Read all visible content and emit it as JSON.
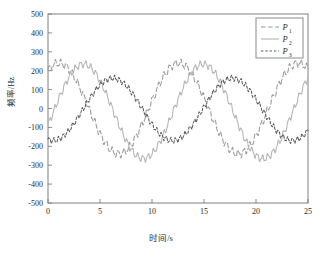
{
  "chart_data": {
    "type": "line",
    "title": "",
    "xlabel": "时间/s",
    "ylabel": "频率/Hz",
    "xlim": [
      0,
      25
    ],
    "ylim": [
      -500,
      500
    ],
    "xticks": [
      0,
      5,
      10,
      15,
      20,
      25
    ],
    "yticks": [
      -500,
      -400,
      -300,
      -200,
      -100,
      0,
      100,
      200,
      300,
      400,
      500
    ],
    "xticklabels": [
      "0",
      "5",
      "10",
      "15",
      "20",
      "25"
    ],
    "yticklabels": [
      "-500",
      "-400",
      "-300",
      "-200",
      "-100",
      "0",
      "100",
      "200",
      "300",
      "400",
      "500"
    ],
    "grid": false,
    "legend_position": "upper right",
    "legend": [
      {
        "name": "P1",
        "label": "P",
        "subscript": "1",
        "style": "long-dashed",
        "color": "#9a9a9a"
      },
      {
        "name": "P2",
        "label": "P",
        "subscript": "2",
        "style": "solid",
        "color": "#b3b3b3"
      },
      {
        "name": "P3",
        "label": "P",
        "subscript": "3",
        "style": "short-dashed",
        "color": "#5a5a5a"
      }
    ],
    "series": [
      {
        "name": "P1",
        "label": "P1",
        "color": "#9a9a9a",
        "style": "long-dashed",
        "amplitude": 240,
        "offset": 0,
        "period": 11.5,
        "phase_deg": 57,
        "noise_amplitude": 18,
        "noise_period": 0.55,
        "x": [
          0,
          0.5,
          1,
          1.5,
          2,
          2.5,
          3,
          3.5,
          4,
          4.5,
          5,
          5.5,
          6,
          6.5,
          7,
          7.5,
          8,
          8.5,
          9,
          9.5,
          10,
          10.5,
          11,
          11.5,
          12,
          12.5,
          13,
          13.5,
          14,
          14.5,
          15,
          15.5,
          16,
          16.5,
          17,
          17.5,
          18,
          18.5,
          19,
          19.5,
          20,
          20.5,
          21,
          21.5,
          22,
          22.5,
          23,
          23.5,
          24,
          24.5,
          25
        ],
        "y": [
          200,
          240,
          268,
          283,
          288,
          282,
          265,
          238,
          203,
          160,
          112,
          60,
          6,
          -48,
          -100,
          -148,
          -190,
          -225,
          -253,
          -272,
          -283,
          -285,
          -278,
          -262,
          -238,
          -207,
          -170,
          -128,
          -82,
          -34,
          15,
          65,
          113,
          158,
          199,
          234,
          262,
          281,
          290,
          288,
          276,
          254,
          223,
          184,
          139,
          90,
          38,
          -15,
          -68,
          -118,
          -165
        ]
      },
      {
        "name": "P2",
        "label": "P2",
        "color": "#b3b3b3",
        "style": "solid",
        "amplitude": 250,
        "offset": -15,
        "period": 11.5,
        "phase_deg": -17,
        "noise_amplitude": 16,
        "noise_period": 0.5,
        "x": [
          0,
          0.5,
          1,
          1.5,
          2,
          2.5,
          3,
          3.5,
          4,
          4.5,
          5,
          5.5,
          6,
          6.5,
          7,
          7.5,
          8,
          8.5,
          9,
          9.5,
          10,
          10.5,
          11,
          11.5,
          12,
          12.5,
          13,
          13.5,
          14,
          14.5,
          15,
          15.5,
          16,
          16.5,
          17,
          17.5,
          18,
          18.5,
          19,
          19.5,
          20,
          20.5,
          21,
          21.5,
          22,
          22.5,
          23,
          23.5,
          24,
          24.5,
          25
        ],
        "y": [
          -75,
          -30,
          20,
          68,
          115,
          158,
          196,
          226,
          245,
          252,
          248,
          233,
          208,
          174,
          133,
          88,
          38,
          -12,
          -63,
          -112,
          -157,
          -197,
          -229,
          -252,
          -265,
          -268,
          -260,
          -241,
          -213,
          -175,
          -131,
          -82,
          -30,
          22,
          75,
          125,
          170,
          208,
          237,
          254,
          258,
          250,
          230,
          199,
          159,
          112,
          61,
          8,
          -45,
          -97,
          -145
        ]
      },
      {
        "name": "P3",
        "label": "P3",
        "color": "#5a5a5a",
        "style": "short-dashed",
        "amplitude": 165,
        "offset": -5,
        "period": 11.5,
        "phase_deg": -105,
        "noise_amplitude": 13,
        "noise_period": 0.45,
        "x": [
          0,
          0.5,
          1,
          1.5,
          2,
          2.5,
          3,
          3.5,
          4,
          4.5,
          5,
          5.5,
          6,
          6.5,
          7,
          7.5,
          8,
          8.5,
          9,
          9.5,
          10,
          10.5,
          11,
          11.5,
          12,
          12.5,
          13,
          13.5,
          14,
          14.5,
          15,
          15.5,
          16,
          16.5,
          17,
          17.5,
          18,
          18.5,
          19,
          19.5,
          20,
          20.5,
          21,
          21.5,
          22,
          22.5,
          23,
          23.5,
          24,
          24.5,
          25
        ],
        "y": [
          -160,
          -150,
          -133,
          -110,
          -82,
          -50,
          -15,
          22,
          58,
          92,
          122,
          144,
          158,
          164,
          160,
          148,
          128,
          102,
          70,
          35,
          -2,
          -40,
          -76,
          -108,
          -135,
          -153,
          -163,
          -165,
          -157,
          -141,
          -117,
          -86,
          -50,
          -12,
          27,
          65,
          100,
          130,
          152,
          165,
          168,
          161,
          145,
          121,
          91,
          56,
          18,
          -20,
          -58,
          -94,
          -125
        ]
      }
    ]
  },
  "axes": {
    "ylabel_text": "频率/Hz",
    "xlabel_text": "时间/s"
  }
}
